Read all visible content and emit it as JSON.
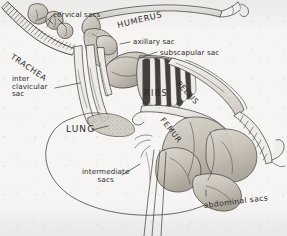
{
  "figure": {
    "medium": "pen-and-ink stipple drawing, scanned",
    "background_color": "#f6f5f3",
    "ink_color": "#3a3a38",
    "tissue_fill": "#c9c4bb"
  },
  "labels": {
    "cervical_sacs": "cervical sacs",
    "trachea": "TRACHEA",
    "humerus": "HUMERUS",
    "axillary_sac": "axillary sac",
    "subscapular_sac": "subscapular sac",
    "interclavicular_line1": "inter",
    "interclavicular_line2": "clavicular",
    "interclavicular_line3": "sac",
    "ribs": "RIBS",
    "pelvis": "PELVIS",
    "femur": "FEMUR",
    "lung": "LUNG",
    "intermediate_line1": "intermediate",
    "intermediate_line2": "sacs",
    "abdominal_sacs": "abdominal sacs"
  },
  "structures": [
    {
      "name": "cervical sacs",
      "kind": "air sac",
      "region": "neck"
    },
    {
      "name": "interclavicular sac",
      "kind": "air sac",
      "region": "thorax, midline"
    },
    {
      "name": "axillary sac",
      "kind": "air sac",
      "region": "shoulder"
    },
    {
      "name": "subscapular sac",
      "kind": "air sac",
      "region": "under scapula"
    },
    {
      "name": "intermediate sacs",
      "kind": "air sac",
      "region": "mid body"
    },
    {
      "name": "abdominal sacs",
      "kind": "air sac",
      "region": "abdomen"
    },
    {
      "name": "lung",
      "kind": "organ",
      "region": "dorsal thorax"
    },
    {
      "name": "trachea",
      "kind": "airway",
      "region": "neck"
    },
    {
      "name": "humerus",
      "kind": "bone",
      "region": "wing"
    },
    {
      "name": "ribs",
      "kind": "bone",
      "region": "thorax"
    },
    {
      "name": "pelvis",
      "kind": "bone",
      "region": "hip"
    },
    {
      "name": "femur",
      "kind": "bone",
      "region": "thigh"
    }
  ]
}
